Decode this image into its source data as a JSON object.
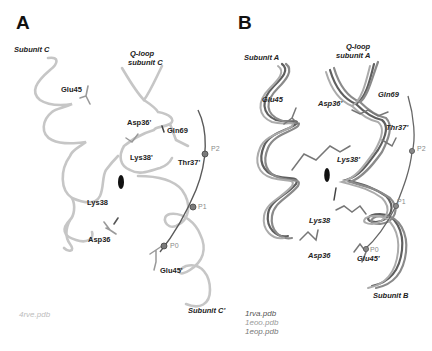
{
  "panels": {
    "A": {
      "letter": "A",
      "labels": {
        "subunit_c": "Subunit C",
        "qloop": "Q-loop",
        "qloop_sub": "subunit C",
        "glu45": "Glu45",
        "asp36p": "Asp36'",
        "gln69": "Gln69",
        "lys38p": "Lys38'",
        "thr37p": "Thr37'",
        "lys38": "Lys38",
        "asp36": "Asp36",
        "glu45p": "Glu45'",
        "subunit_cp": "Subunit C'"
      },
      "pore_sites": [
        "P2",
        "P1",
        "P0"
      ],
      "pdb": [
        "4rve.pdb"
      ],
      "colors": {
        "helix": "#c4c4c4",
        "axis": "#555555",
        "pdb": "#bdbdbd"
      }
    },
    "B": {
      "letter": "B",
      "labels": {
        "subunit_a": "Subunit A",
        "qloop": "Q-loop",
        "qloop_sub": "subunit A",
        "glu45": "Glu45",
        "asp36p": "Asp36'",
        "gln69": "Gln69",
        "thr37p": "Thr37'",
        "lys38p": "Lys38'",
        "lys38": "Lys38",
        "asp36": "Asp36",
        "glu45p": "Glu45'",
        "subunit_b": "Subunit B"
      },
      "pore_sites": [
        "P2",
        "P1",
        "P0"
      ],
      "pdb": [
        "1rva.pdb",
        "1eoo.pdb",
        "1eop.pdb"
      ],
      "colors": {
        "helix1": "#5f5f5f",
        "helix2": "#8a8a8a",
        "helix3": "#a8a8a8",
        "axis": "#666666",
        "pdb1": "#555555",
        "pdb2": "#9a9a9a",
        "pdb3": "#777777"
      }
    }
  }
}
